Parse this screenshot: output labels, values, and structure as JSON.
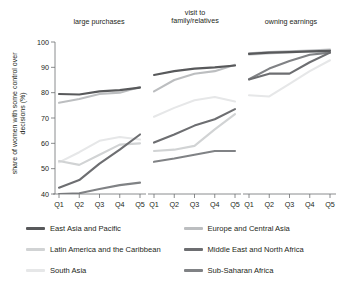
{
  "chart_data": {
    "type": "line",
    "title": "",
    "ylabel": "share of women with some control\nover decisions (%)",
    "xlabel": "",
    "ylim": [
      40,
      100
    ],
    "yticks": [
      40,
      50,
      60,
      70,
      80,
      90,
      100
    ],
    "categories": [
      "Q1",
      "Q2",
      "Q3",
      "Q4",
      "Q5"
    ],
    "grid": false,
    "legend_position": "bottom",
    "panels": [
      {
        "title": "large purchases",
        "series": [
          {
            "name": "East Asia and Pacific",
            "values": [
              79.5,
              79.3,
              80.5,
              81.0,
              82.0
            ]
          },
          {
            "name": "Europe and Central Asia",
            "values": [
              76.0,
              77.5,
              79.5,
              80.0,
              82.2
            ]
          },
          {
            "name": "Latin America and the Caribbean",
            "values": [
              53.0,
              51.5,
              55.5,
              59.5,
              60.0
            ]
          },
          {
            "name": "Middle East and North Africa",
            "values": [
              42.5,
              45.5,
              52.0,
              57.5,
              63.5
            ]
          },
          {
            "name": "South Asia",
            "values": [
              52.5,
              56.5,
              61.0,
              62.5,
              61.5
            ]
          },
          {
            "name": "Sub-Saharan Africa",
            "values": [
              40.0,
              40.3,
              42.0,
              43.5,
              44.5
            ]
          }
        ]
      },
      {
        "title": "visit to\nfamily/relatives",
        "series": [
          {
            "name": "East Asia and Pacific",
            "values": [
              87.0,
              88.5,
              89.5,
              90.0,
              90.7
            ]
          },
          {
            "name": "Europe and Central Asia",
            "values": [
              80.5,
              85.0,
              87.5,
              88.5,
              91.0
            ]
          },
          {
            "name": "Latin America and the Caribbean",
            "values": [
              57.0,
              57.5,
              59.0,
              65.5,
              71.5
            ]
          },
          {
            "name": "Middle East and North Africa",
            "values": [
              60.3,
              63.5,
              67.0,
              69.5,
              73.5
            ]
          },
          {
            "name": "South Asia",
            "values": [
              70.5,
              74.0,
              77.0,
              78.3,
              76.5
            ]
          },
          {
            "name": "Sub-Saharan Africa",
            "values": [
              52.7,
              54.0,
              55.5,
              57.0,
              57.0
            ]
          }
        ]
      },
      {
        "title": "owning earnings",
        "series": [
          {
            "name": "East Asia and Pacific",
            "values": [
              95.3,
              95.8,
              96.0,
              96.3,
              96.5
            ]
          },
          {
            "name": "Europe and Central Asia",
            "values": [
              95.5,
              96.0,
              96.3,
              96.6,
              97.0
            ]
          },
          {
            "name": "Latin America and the Caribbean",
            "values": [
              95.0,
              95.5,
              96.0,
              96.2,
              96.0
            ]
          },
          {
            "name": "Middle East and North Africa",
            "values": [
              85.2,
              87.5,
              87.5,
              92.0,
              95.8
            ]
          },
          {
            "name": "South Asia",
            "values": [
              79.0,
              78.5,
              83.5,
              88.5,
              92.8
            ]
          },
          {
            "name": "Sub-Saharan Africa",
            "values": [
              85.3,
              89.5,
              92.5,
              95.0,
              95.8
            ]
          }
        ]
      }
    ],
    "legend": [
      {
        "name": "East Asia and Pacific",
        "color": "#58595b"
      },
      {
        "name": "Europe and Central Asia",
        "color": "#bcbec0"
      },
      {
        "name": "Latin America and the Caribbean",
        "color": "#d1d3d4"
      },
      {
        "name": "Middle East and North Africa",
        "color": "#6d6e71"
      },
      {
        "name": "South Asia",
        "color": "#e6e7e8"
      },
      {
        "name": "Sub-Saharan Africa",
        "color": "#808285"
      }
    ]
  }
}
